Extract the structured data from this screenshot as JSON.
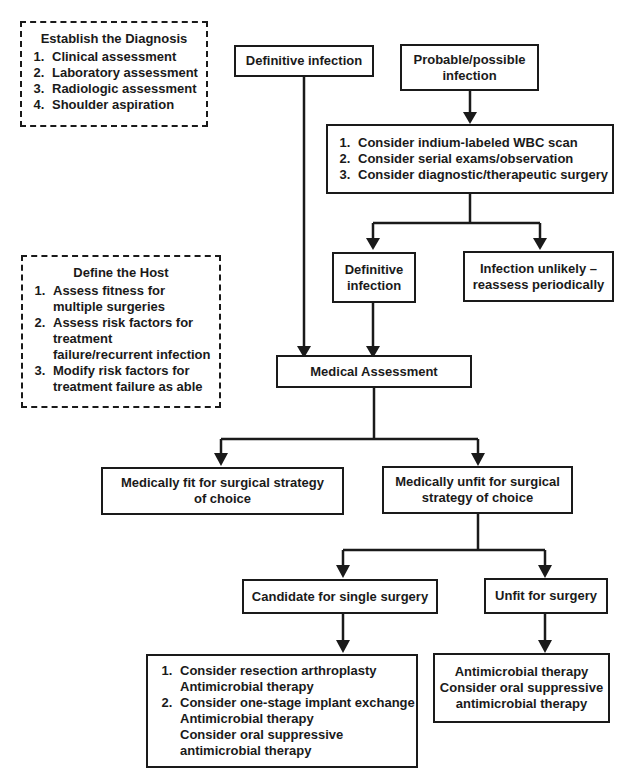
{
  "sidebar_notes": {
    "diagnosis": {
      "title": "Establish the Diagnosis",
      "items": [
        "Clinical assessment",
        "Laboratory assessment",
        "Radiologic assessment",
        "Shoulder aspiration"
      ]
    },
    "host": {
      "title": "Define the Host",
      "items": [
        "Assess fitness for multiple surgeries",
        "Assess risk factors for treatment failure/recurrent infection",
        "Modify risk factors for treatment failure as able"
      ]
    }
  },
  "nodes": {
    "definitive_infection_top": "Definitive infection",
    "probable_infection": {
      "line1": "Probable/possible",
      "line2": "infection"
    },
    "workup": {
      "items": [
        "Consider indium-labeled WBC scan",
        "Consider serial exams/observation",
        "Consider diagnostic/therapeutic surgery"
      ]
    },
    "definitive_infection_mid": {
      "line1": "Definitive",
      "line2": "infection"
    },
    "infection_unlikely": {
      "line1": "Infection unlikely –",
      "line2": "reassess periodically"
    },
    "medical_assessment": "Medical Assessment",
    "medically_fit": {
      "line1": "Medically fit for surgical strategy",
      "line2": "of choice"
    },
    "medically_unfit": {
      "line1": "Medically unfit for surgical",
      "line2": "strategy of choice"
    },
    "single_surgery_candidate": "Candidate for single surgery",
    "unfit_for_surgery": "Unfit for surgery",
    "single_surgery_options": {
      "item1": {
        "main": "Consider resection arthroplasty",
        "sub": "Antimicrobial therapy"
      },
      "item2": {
        "main": "Consider one-stage implant exchange",
        "sub1": "Antimicrobial therapy",
        "sub2": "Consider oral suppressive",
        "sub3": "antimicrobial therapy"
      }
    },
    "unfit_options": {
      "line1": "Antimicrobial therapy",
      "line2": "Consider oral suppressive",
      "line3": "antimicrobial therapy"
    }
  }
}
